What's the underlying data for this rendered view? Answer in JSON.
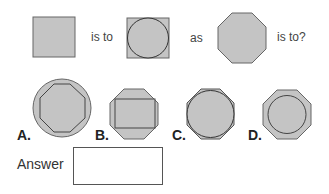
{
  "question": {
    "connector_1": "is to",
    "connector_2": "as",
    "connector_3": "is to?"
  },
  "options": [
    {
      "label": "A.",
      "description": "octagon inside circle"
    },
    {
      "label": "B.",
      "description": "rectangle inside octagon"
    },
    {
      "label": "C.",
      "description": "circle inscribed in octagon (tight)"
    },
    {
      "label": "D.",
      "description": "circle inside octagon"
    }
  ],
  "answer": {
    "label": "Answer",
    "value": ""
  },
  "colors": {
    "shape_fill": "#c4c4c4",
    "shape_stroke": "#555555",
    "text": "#444444"
  }
}
